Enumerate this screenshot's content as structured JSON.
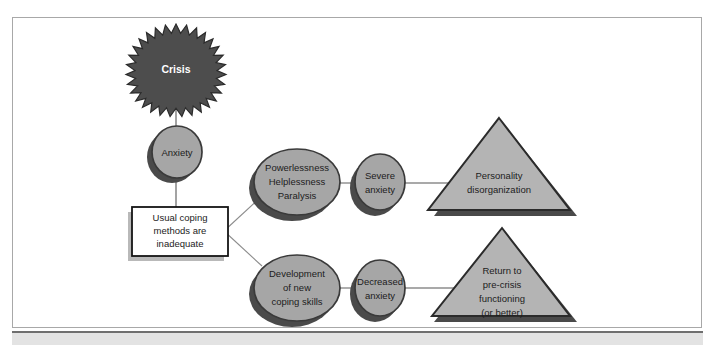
{
  "page": {
    "background_color": "#ffffff",
    "frame_border_color": "#a8a8a8",
    "bottom_band_color": "#e3e3e3",
    "bottom_rule_color": "#6f6f6f"
  },
  "palette": {
    "shape_fill": "#a6a6a6",
    "shape_fill_light": "#b4b4b4",
    "shape_stroke": "#3a3a3a",
    "shadow": "#4a4a4a",
    "burst_fill": "#4d4d4d",
    "burst_stroke": "#2b2b2b",
    "box_fill": "#ffffff",
    "box_stroke": "#141414",
    "box_shadow": "#b9b9b9",
    "connector": "#8c8c8c",
    "text": "#1c1c1c",
    "text_inverse": "#ffffff"
  },
  "nodes": {
    "crisis": {
      "shape": "starburst",
      "label": "Crisis",
      "lines": [
        "Crisis"
      ]
    },
    "anxiety": {
      "shape": "circle",
      "label": "Anxiety",
      "lines": [
        "Anxiety"
      ]
    },
    "coping_box": {
      "shape": "rectangle",
      "label": "Usual coping methods are inadequate",
      "lines": [
        "Usual coping",
        "methods are",
        "inadequate"
      ]
    },
    "powerlessness": {
      "shape": "ellipse",
      "label": "Powerlessness Helplessness Paralysis",
      "lines": [
        "Powerlessness",
        "Helplessness",
        "Paralysis"
      ]
    },
    "severe_anxiety": {
      "shape": "circle",
      "label": "Severe anxiety",
      "lines": [
        "Severe",
        "anxiety"
      ]
    },
    "personality_disorganization": {
      "shape": "triangle",
      "label": "Personality disorganization",
      "lines": [
        "Personality",
        "disorganization"
      ]
    },
    "development": {
      "shape": "ellipse",
      "label": "Development of new coping skills",
      "lines": [
        "Development",
        "of new",
        "coping skills"
      ]
    },
    "decreased_anxiety": {
      "shape": "circle",
      "label": "Decreased anxiety",
      "lines": [
        "Decreased",
        "anxiety"
      ]
    },
    "return_precrisis": {
      "shape": "triangle",
      "label": "Return to pre-crisis functioning (or better)",
      "lines": [
        "Return to",
        "pre-crisis",
        "functioning",
        "(or better)"
      ]
    }
  },
  "connectors": [
    {
      "name": "crisis-to-anxiety",
      "from": "crisis",
      "to": "anxiety"
    },
    {
      "name": "anxiety-to-coping-box",
      "from": "anxiety",
      "to": "coping_box"
    },
    {
      "name": "coping-box-to-powerlessness",
      "from": "coping_box",
      "to": "powerlessness"
    },
    {
      "name": "coping-box-to-development",
      "from": "coping_box",
      "to": "development"
    },
    {
      "name": "powerlessness-to-severe-anxiety",
      "from": "powerlessness",
      "to": "severe_anxiety"
    },
    {
      "name": "severe-anxiety-to-personality-disorganization",
      "from": "severe_anxiety",
      "to": "personality_disorganization"
    },
    {
      "name": "development-to-decreased-anxiety",
      "from": "development",
      "to": "decreased_anxiety"
    },
    {
      "name": "decreased-anxiety-to-return-precrisis",
      "from": "decreased_anxiety",
      "to": "return_precrisis"
    }
  ]
}
